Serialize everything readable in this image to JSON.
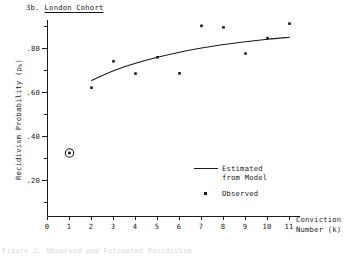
{
  "figure": {
    "number": "3b.",
    "name": "London Cohort"
  },
  "axes": {
    "y_title_main": "Recidivism Probability (p",
    "y_title_sub": "k",
    "y_title_close": ")",
    "x_title_line1": "Conviction",
    "x_title_line2": "Number (k)",
    "y_tick_labels": [
      ".20",
      ".40",
      ".60",
      ".80"
    ],
    "x_tick_labels": [
      "0",
      "1",
      "2",
      "3",
      "4",
      "5",
      "6",
      "7",
      "8",
      "9",
      "10",
      "11"
    ]
  },
  "legend": {
    "estimated_line1": "Estimated",
    "estimated_line2": "from Model",
    "observed": "Observed"
  },
  "caption_cutoff": "Figure 3.  Observed and Estimated Recidivism",
  "colors": {
    "ink": "#1a1a1a",
    "background": "#ffffff",
    "marker": "#1a1a1a"
  },
  "chart_data": {
    "type": "scatter",
    "xlabel": "Conviction Number (k)",
    "ylabel": "Recidivism Probability (p_k)",
    "xlim": [
      0,
      11.6
    ],
    "ylim": [
      0,
      0.95
    ],
    "grid": false,
    "legend_position": "lower-right",
    "y_ticks_major": [
      0.2,
      0.4,
      0.6,
      0.8
    ],
    "y_ticks_minor": [
      0.1,
      0.3,
      0.5,
      0.7,
      0.9
    ],
    "x_ticks": [
      0,
      1,
      2,
      3,
      4,
      5,
      6,
      7,
      8,
      9,
      10,
      11
    ],
    "series": [
      {
        "name": "Observed",
        "type": "scatter",
        "marker": "square-dot",
        "x": [
          1,
          2,
          3,
          4,
          5,
          6,
          7,
          8,
          9,
          10,
          11
        ],
        "values": [
          0.325,
          0.622,
          0.742,
          0.686,
          0.76,
          0.687,
          0.903,
          0.896,
          0.777,
          0.847,
          0.913
        ],
        "highlighted_points": [
          {
            "x": 1,
            "y": 0.325,
            "annotation": "circled"
          }
        ]
      },
      {
        "name": "Estimated from Model",
        "type": "line",
        "x": [
          2,
          3,
          4,
          5,
          6,
          7,
          8,
          9,
          10,
          11
        ],
        "values": [
          0.655,
          0.699,
          0.733,
          0.76,
          0.783,
          0.802,
          0.818,
          0.831,
          0.842,
          0.851
        ]
      }
    ]
  }
}
